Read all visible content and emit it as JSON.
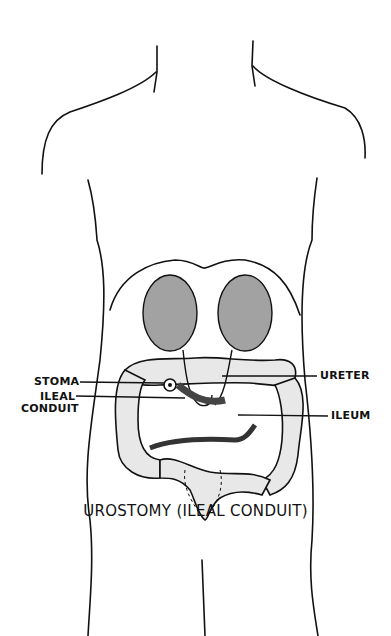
{
  "figure": {
    "caption": "UROSTOMY (ILEAL CONDUIT)",
    "labels": {
      "stoma": "STOMA",
      "ileal_conduit_line1": "ILEAL",
      "ileal_conduit_line2": "CONDUIT",
      "ureter": "URETER",
      "ileum": "ILEUM"
    },
    "colors": {
      "ink": "#111111",
      "background": "#ffffff"
    }
  }
}
